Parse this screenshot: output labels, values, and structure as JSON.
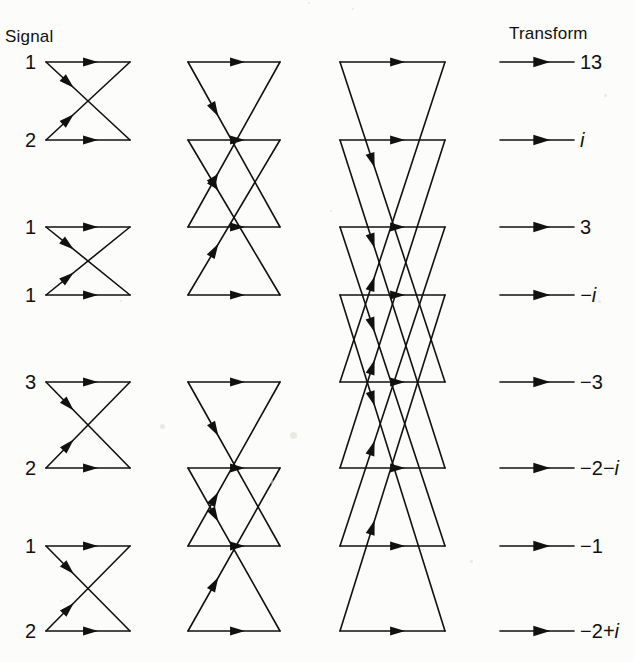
{
  "headers": {
    "signal": "Signal",
    "transform": "Transform"
  },
  "diagram": {
    "type": "fft-butterfly-flow-graph",
    "rows": 8,
    "stages": 3,
    "row_y": [
      62,
      140,
      227,
      295,
      382,
      468,
      546,
      631
    ],
    "stage_x": [
      {
        "left": 46,
        "right": 130
      },
      {
        "left": 188,
        "right": 280
      },
      {
        "left": 340,
        "right": 445
      }
    ],
    "output_arrow": {
      "x_start": 500,
      "x_end": 574,
      "label_x": 580
    },
    "stroke_color": "#111111",
    "stroke_width": 1.6,
    "background_color": "#fcfcfa"
  },
  "signal_inputs": [
    {
      "index": 0,
      "value": "1"
    },
    {
      "index": 1,
      "value": "2"
    },
    {
      "index": 2,
      "value": "1"
    },
    {
      "index": 3,
      "value": "1"
    },
    {
      "index": 4,
      "value": "3"
    },
    {
      "index": 5,
      "value": "2"
    },
    {
      "index": 6,
      "value": "1"
    },
    {
      "index": 7,
      "value": "2"
    }
  ],
  "transform_outputs": [
    {
      "index": 0,
      "text": "13",
      "real": "13",
      "imag": ""
    },
    {
      "index": 1,
      "text": "i",
      "real": "",
      "imag": "i"
    },
    {
      "index": 2,
      "text": "3",
      "real": "3",
      "imag": ""
    },
    {
      "index": 3,
      "text": "−i",
      "real": "",
      "imag": "−i"
    },
    {
      "index": 4,
      "text": "−3",
      "real": "−3",
      "imag": ""
    },
    {
      "index": 5,
      "text": "−2−i",
      "real": "−2",
      "imag": "−i"
    },
    {
      "index": 6,
      "text": "−1",
      "real": "−1",
      "imag": ""
    },
    {
      "index": 7,
      "text": "−2+i",
      "real": "−2",
      "imag": "+i"
    }
  ],
  "butterflies": {
    "stage1_pairs": [
      [
        0,
        1
      ],
      [
        2,
        3
      ],
      [
        4,
        5
      ],
      [
        6,
        7
      ]
    ],
    "stage2_pairs": [
      [
        0,
        2
      ],
      [
        1,
        3
      ],
      [
        4,
        6
      ],
      [
        5,
        7
      ]
    ],
    "stage3_pairs": [
      [
        0,
        4
      ],
      [
        1,
        5
      ],
      [
        2,
        6
      ],
      [
        3,
        7
      ]
    ]
  }
}
